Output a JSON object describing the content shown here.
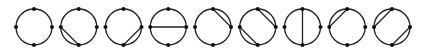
{
  "diagram": {
    "stroke_color": "#222222",
    "dot_color": "#111111",
    "background": "#ffffff",
    "radius": 18,
    "center_y": 27,
    "points": [
      "top",
      "right",
      "bottom",
      "left"
    ],
    "circles": [
      {
        "cx": 34,
        "chords": []
      },
      {
        "cx": 78.75,
        "chords": [
          [
            "left",
            "bottom"
          ]
        ]
      },
      {
        "cx": 123.5,
        "chords": [
          [
            "bottom",
            "right"
          ]
        ]
      },
      {
        "cx": 168.25,
        "chords": [
          [
            "left",
            "right"
          ]
        ]
      },
      {
        "cx": 213,
        "chords": [
          [
            "top",
            "right"
          ]
        ]
      },
      {
        "cx": 257.75,
        "chords": [
          [
            "top",
            "right"
          ],
          [
            "left",
            "bottom"
          ]
        ]
      },
      {
        "cx": 302.5,
        "chords": [
          [
            "top",
            "bottom"
          ]
        ]
      },
      {
        "cx": 347.25,
        "chords": [
          [
            "left",
            "top"
          ]
        ]
      },
      {
        "cx": 392,
        "chords": [
          [
            "left",
            "top"
          ],
          [
            "bottom",
            "right"
          ]
        ]
      }
    ]
  }
}
